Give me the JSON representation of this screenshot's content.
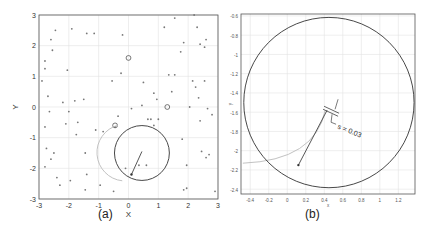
{
  "chart_data": [
    {
      "id": "a",
      "type": "scatter",
      "caption": "(a)",
      "xlabel": "X",
      "ylabel": "Y",
      "xlim": [
        -3,
        3
      ],
      "ylim": [
        -3,
        3
      ],
      "xticks": [
        "-3",
        "-2",
        "-1",
        "0",
        "1",
        "2",
        "3"
      ],
      "yticks": [
        "3",
        "2",
        "1",
        "0",
        "-1",
        "-2",
        "-3"
      ],
      "grid": true,
      "points": [
        [
          -2.9,
          0.85
        ],
        [
          -2.8,
          1.5
        ],
        [
          -2.8,
          1.25
        ],
        [
          -2.7,
          0.35
        ],
        [
          -2.65,
          -0.15
        ],
        [
          -2.8,
          -0.65
        ],
        [
          -2.75,
          -1.35
        ],
        [
          -2.8,
          -1.95
        ],
        [
          -2.6,
          2.2
        ],
        [
          -2.55,
          1.85
        ],
        [
          -2.45,
          2.5
        ],
        [
          -2.5,
          -1.5
        ],
        [
          -2.4,
          -2.3
        ],
        [
          -2.3,
          -2.55
        ],
        [
          -2.2,
          0.15
        ],
        [
          -2.1,
          -0.55
        ],
        [
          -2.05,
          1.2
        ],
        [
          -2.0,
          -0.15
        ],
        [
          -1.9,
          2.55
        ],
        [
          -1.95,
          -2.4
        ],
        [
          -1.8,
          0.2
        ],
        [
          -1.75,
          -0.9
        ],
        [
          -1.7,
          -0.5
        ],
        [
          -1.5,
          0.25
        ],
        [
          -1.45,
          -1.5
        ],
        [
          -1.4,
          2.4
        ],
        [
          -1.4,
          -2.2
        ],
        [
          -1.45,
          -2.7
        ],
        [
          -1.15,
          2.4
        ],
        [
          -1.1,
          -0.75
        ],
        [
          -0.95,
          -2.55
        ],
        [
          -0.55,
          0.85
        ],
        [
          -0.5,
          -2.75
        ],
        [
          -0.35,
          -0.3
        ],
        [
          -0.2,
          2.35
        ],
        [
          -0.25,
          1.1
        ],
        [
          -0.1,
          -2.0
        ],
        [
          0.1,
          -0.05
        ],
        [
          0.45,
          0.05
        ],
        [
          0.5,
          0.8
        ],
        [
          0.65,
          -0.4
        ],
        [
          0.75,
          -0.4
        ],
        [
          0.85,
          0.45
        ],
        [
          0.85,
          -0.6
        ],
        [
          0.95,
          0.25
        ],
        [
          1.0,
          -0.4
        ],
        [
          1.2,
          2.6
        ],
        [
          1.35,
          1.05
        ],
        [
          1.45,
          0.5
        ],
        [
          1.55,
          1.05
        ],
        [
          1.55,
          2.9
        ],
        [
          1.75,
          1.8
        ],
        [
          1.8,
          -1.05
        ],
        [
          1.85,
          -2.7
        ],
        [
          1.85,
          2.1
        ],
        [
          1.95,
          -2.65
        ],
        [
          1.95,
          -1.9
        ],
        [
          2.05,
          0.0
        ],
        [
          2.15,
          0.85
        ],
        [
          2.2,
          3.0
        ],
        [
          2.25,
          0.65
        ],
        [
          2.3,
          2.6
        ],
        [
          2.35,
          0.3
        ],
        [
          2.4,
          -0.45
        ],
        [
          2.4,
          2.05
        ],
        [
          2.45,
          -1.45
        ],
        [
          2.55,
          0.85
        ],
        [
          2.55,
          1.95
        ],
        [
          2.6,
          2.2
        ],
        [
          2.6,
          -1.65
        ],
        [
          2.65,
          -0.05
        ],
        [
          2.7,
          -1.55
        ],
        [
          2.8,
          -0.25
        ],
        [
          2.9,
          -2.75
        ],
        [
          0.6,
          -1.9
        ],
        [
          0.35,
          -1.9
        ],
        [
          -0.85,
          -0.8
        ],
        [
          -0.45,
          -0.65
        ],
        [
          -2.6,
          -1.7
        ]
      ],
      "open_markers": [
        [
          0.0,
          1.6
        ],
        [
          1.3,
          0.0
        ],
        [
          -0.45,
          -0.6
        ]
      ],
      "circle": {
        "center": [
          0.45,
          -1.5
        ],
        "radius": 0.92
      },
      "arc": {
        "center": [
          -0.4,
          -1.5
        ],
        "radius": 0.95,
        "color": "#bbbbbb"
      },
      "segment": {
        "from": [
          0.45,
          -1.45
        ],
        "to": [
          0.1,
          -2.2
        ]
      }
    },
    {
      "id": "b",
      "type": "scatter",
      "caption": "(b)",
      "xlabel": "x",
      "ylabel": "y",
      "xlim": [
        -0.5,
        1.38
      ],
      "ylim": [
        -2.45,
        -0.58
      ],
      "xticks": [
        "-0.4",
        "-0.2",
        "0",
        "0.2",
        "0.4",
        "0.6",
        "0.8",
        "1",
        "1.2"
      ],
      "yticks": [
        "-0.6",
        "-0.8",
        "-1",
        "-1.2",
        "-1.4",
        "-1.6",
        "-1.8",
        "-2",
        "-2.2",
        "-2.4"
      ],
      "grid": true,
      "circle": {
        "center": [
          0.45,
          -1.5
        ],
        "radius": 0.92
      },
      "arc": {
        "start": [
          -0.48,
          -2.13
        ],
        "end": [
          0.41,
          -1.58
        ],
        "color": "#bbbbbb"
      },
      "segment": {
        "from": [
          0.43,
          -1.58
        ],
        "to": [
          0.12,
          -2.15
        ]
      },
      "annotation": "s = 0.03"
    }
  ]
}
